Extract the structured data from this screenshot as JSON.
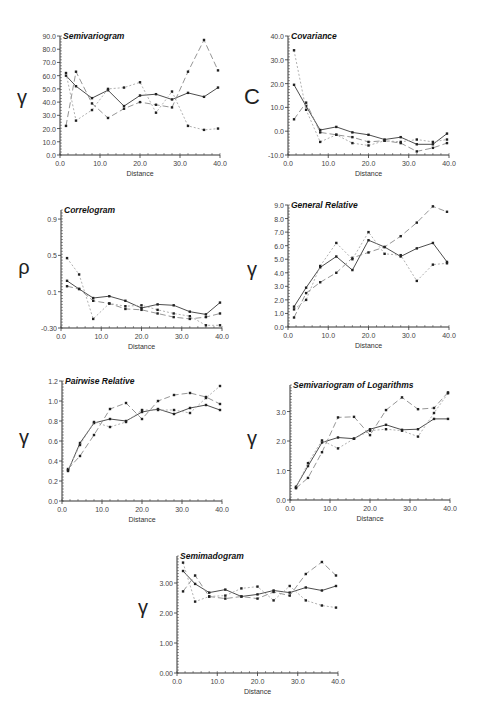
{
  "figure": {
    "x_label": "Distance"
  },
  "styles": {
    "axis_color": "#333333",
    "series": [
      {
        "name": "series-1",
        "style": "solid",
        "color": "#3a3a3a",
        "dash": ""
      },
      {
        "name": "series-2",
        "style": "long-dash",
        "color": "#8a8a8a",
        "dash": "6,3"
      },
      {
        "name": "series-3",
        "style": "dotted",
        "color": "#a8a8a8",
        "dash": "2,2"
      }
    ]
  },
  "chart_data": [
    {
      "id": "semivariogram",
      "type": "line",
      "title": "Semivariogram",
      "xlabel": "Distance",
      "ylabel": "γ",
      "xlim": [
        0,
        40
      ],
      "ylim": [
        0,
        90
      ],
      "xticks": [
        "0.0",
        "10.0",
        "20.0",
        "30.0",
        "40.0"
      ],
      "xtick_values": [
        0,
        10,
        20,
        30,
        40
      ],
      "yticks": [
        "0.0",
        "10.0",
        "20.0",
        "30.0",
        "40.0",
        "50.0",
        "60.0",
        "70.0",
        "80.0",
        "90.0"
      ],
      "ytick_values": [
        0,
        10,
        20,
        30,
        40,
        50,
        60,
        70,
        80,
        90
      ],
      "box": {
        "x0": 60,
        "x1": 220,
        "y0": 36,
        "y1": 155
      },
      "ylabel_pos": {
        "x": 22,
        "y": 104
      },
      "series": [
        {
          "name": "series-1",
          "x": [
            1.5,
            4,
            8,
            12,
            16,
            20,
            24,
            28,
            32,
            36,
            39.5
          ],
          "y": [
            60,
            52,
            43,
            49,
            37,
            45,
            46,
            42,
            47,
            44,
            51
          ]
        },
        {
          "name": "series-2",
          "x": [
            1.5,
            4,
            8,
            12,
            16,
            20,
            24,
            28,
            32,
            36,
            39.5
          ],
          "y": [
            22,
            63,
            39,
            28,
            35,
            40,
            38,
            36,
            63,
            87,
            64
          ]
        },
        {
          "name": "series-3",
          "x": [
            1.5,
            4,
            8,
            12,
            16,
            20,
            24,
            28,
            32,
            36,
            39.5
          ],
          "y": [
            62,
            26,
            34,
            50,
            51,
            55,
            32,
            48,
            22,
            19,
            20
          ]
        }
      ]
    },
    {
      "id": "covariance",
      "type": "line",
      "title": "Covariance",
      "xlabel": "Distance",
      "ylabel": "C",
      "xlim": [
        0,
        40
      ],
      "ylim": [
        -10,
        40
      ],
      "xticks": [
        "0.0",
        "10.0",
        "20.0",
        "30.0",
        "40.0"
      ],
      "xtick_values": [
        0,
        10,
        20,
        30,
        40
      ],
      "yticks": [
        "-10.0",
        "0.0",
        "10.0",
        "20.0",
        "30.0",
        "40.0"
      ],
      "ytick_values": [
        -10,
        0,
        10,
        20,
        30,
        40
      ],
      "box": {
        "x0": 288,
        "x1": 449,
        "y0": 36,
        "y1": 155
      },
      "ylabel_pos": {
        "x": 252,
        "y": 104
      },
      "series": [
        {
          "name": "series-1",
          "x": [
            1.5,
            4.5,
            8,
            12,
            16,
            20,
            24,
            28,
            32,
            36,
            39.5
          ],
          "y": [
            19.5,
            10.5,
            0.5,
            1.8,
            -0.5,
            -1.5,
            -3.5,
            -2.5,
            -5.5,
            -5.5,
            -1.0
          ]
        },
        {
          "name": "series-2",
          "x": [
            1.5,
            4.5,
            8,
            12,
            16,
            20,
            24,
            28,
            32,
            36,
            39.5
          ],
          "y": [
            5,
            12,
            -0.5,
            -1.5,
            -2.5,
            -4.5,
            -4,
            -5,
            -8.5,
            -7,
            -5
          ]
        },
        {
          "name": "series-3",
          "x": [
            1.5,
            4.5,
            8,
            12,
            16,
            20,
            24,
            28,
            32,
            36,
            39.5
          ],
          "y": [
            34,
            9,
            -4.5,
            -1.5,
            -5,
            -6,
            -4,
            -4.5,
            -3.5,
            -4.5,
            -3.5
          ]
        }
      ]
    },
    {
      "id": "correlogram",
      "type": "line",
      "title": "Correlogram",
      "xlabel": "Distance",
      "ylabel": "ρ",
      "xlim": [
        0,
        40
      ],
      "ylim": [
        -0.3,
        1.0
      ],
      "xticks": [
        "0.0",
        "10.0",
        "20.0",
        "30.0",
        "40.0"
      ],
      "xtick_values": [
        0,
        10,
        20,
        30,
        40
      ],
      "yticks": [
        "-0.30",
        "0.1",
        "0.5",
        "0.9"
      ],
      "ytick_values": [
        -0.3,
        0.1,
        0.5,
        0.9
      ],
      "box": {
        "x0": 61,
        "x1": 222,
        "y0": 210,
        "y1": 328
      },
      "ylabel_pos": {
        "x": 24,
        "y": 274
      },
      "series": [
        {
          "name": "series-1",
          "x": [
            1.5,
            4.5,
            8,
            12,
            16,
            20,
            24,
            28,
            32,
            36,
            39.5
          ],
          "y": [
            0.22,
            0.13,
            0.03,
            0.05,
            0.0,
            -0.08,
            -0.04,
            -0.05,
            -0.12,
            -0.15,
            -0.02
          ]
        },
        {
          "name": "series-2",
          "x": [
            1.5,
            4.5,
            8,
            12,
            16,
            20,
            24,
            28,
            32,
            36,
            39.5
          ],
          "y": [
            0.16,
            0.13,
            0.0,
            -0.03,
            -0.09,
            -0.1,
            -0.14,
            -0.18,
            -0.2,
            -0.18,
            -0.14
          ]
        },
        {
          "name": "series-3",
          "x": [
            1.5,
            4.5,
            8,
            12,
            16,
            20,
            24,
            28,
            32,
            36,
            39.5
          ],
          "y": [
            0.47,
            0.29,
            -0.2,
            -0.03,
            -0.06,
            -0.05,
            -0.1,
            -0.14,
            -0.17,
            -0.27,
            -0.27
          ]
        }
      ]
    },
    {
      "id": "general-relative",
      "type": "line",
      "title": "General Relative",
      "xlabel": "Distance",
      "ylabel": "γ",
      "xlim": [
        0,
        40
      ],
      "ylim": [
        0,
        9
      ],
      "xticks": [
        "0.0",
        "10.0",
        "20.0",
        "30.0",
        "40.0"
      ],
      "xtick_values": [
        0,
        10,
        20,
        30,
        40
      ],
      "yticks": [
        "0.0",
        "1.0",
        "2.0",
        "3.0",
        "4.0",
        "5.0",
        "6.0",
        "7.0",
        "8.0",
        "9.0"
      ],
      "ytick_values": [
        0,
        1,
        2,
        3,
        4,
        5,
        6,
        7,
        8,
        9
      ],
      "box": {
        "x0": 288,
        "x1": 449,
        "y0": 205,
        "y1": 327
      },
      "ylabel_pos": {
        "x": 252,
        "y": 276
      },
      "series": [
        {
          "name": "series-1",
          "x": [
            1.5,
            4.5,
            8,
            12,
            16,
            20,
            24,
            28,
            32,
            36,
            39.5
          ],
          "y": [
            1.5,
            2.9,
            4.4,
            5.2,
            4.2,
            6.4,
            5.9,
            5.2,
            5.8,
            6.2,
            4.8
          ]
        },
        {
          "name": "series-2",
          "x": [
            1.5,
            4.5,
            8,
            12,
            16,
            20,
            24,
            28,
            32,
            36,
            39.5
          ],
          "y": [
            0.7,
            2.5,
            3.3,
            4.0,
            5.1,
            5.5,
            5.9,
            6.7,
            7.7,
            8.9,
            8.5
          ]
        },
        {
          "name": "series-3",
          "x": [
            1.5,
            4.5,
            8,
            12,
            16,
            20,
            24,
            28,
            32,
            36,
            39.5
          ],
          "y": [
            1.3,
            2.0,
            4.5,
            6.2,
            5.0,
            7.0,
            5.4,
            5.3,
            3.4,
            4.6,
            4.7
          ]
        }
      ]
    },
    {
      "id": "pairwise-relative",
      "type": "line",
      "title": "Pairwise Relative",
      "xlabel": "Distance",
      "ylabel": "γ",
      "xlim": [
        0,
        40
      ],
      "ylim": [
        0,
        1.2
      ],
      "xticks": [
        "0.0",
        "10.0",
        "20.0",
        "30.0",
        "40.0"
      ],
      "xtick_values": [
        0,
        10,
        20,
        30,
        40
      ],
      "yticks": [
        "0.0",
        "0.2",
        "0.4",
        "0.6",
        "0.8",
        "1.0",
        "1.2"
      ],
      "ytick_values": [
        0,
        0.2,
        0.4,
        0.6,
        0.8,
        1.0,
        1.2
      ],
      "box": {
        "x0": 62,
        "x1": 222,
        "y0": 381,
        "y1": 501
      },
      "ylabel_pos": {
        "x": 24,
        "y": 444
      },
      "series": [
        {
          "name": "series-1",
          "x": [
            1.5,
            4.5,
            8,
            12,
            16,
            20,
            24,
            28,
            32,
            36,
            39.5
          ],
          "y": [
            0.3,
            0.58,
            0.78,
            0.82,
            0.8,
            0.89,
            0.92,
            0.87,
            0.93,
            0.96,
            0.91
          ]
        },
        {
          "name": "series-2",
          "x": [
            1.5,
            4.5,
            8,
            12,
            16,
            20,
            24,
            28,
            32,
            36,
            39.5
          ],
          "y": [
            0.32,
            0.45,
            0.66,
            0.92,
            0.98,
            0.82,
            1.0,
            1.06,
            1.08,
            1.04,
            0.97
          ]
        },
        {
          "name": "series-3",
          "x": [
            1.5,
            4.5,
            8,
            12,
            16,
            20,
            24,
            28,
            32,
            36,
            39.5
          ],
          "y": [
            0.31,
            0.56,
            0.79,
            0.74,
            0.79,
            0.91,
            0.91,
            0.91,
            0.88,
            1.03,
            1.15
          ]
        }
      ]
    },
    {
      "id": "semivariogram-of-logarithms",
      "type": "line",
      "title": "Semivariogram of Logarithms",
      "xlabel": "Distance",
      "ylabel": "γ",
      "xlim": [
        0,
        40
      ],
      "ylim": [
        0,
        3.9
      ],
      "xticks": [
        "0.0",
        "10.0",
        "20.0",
        "30.0",
        "40.0"
      ],
      "xtick_values": [
        0,
        10,
        20,
        30,
        40
      ],
      "yticks": [
        "0.0",
        "1.0",
        "2.0",
        "3.0"
      ],
      "ytick_values": [
        0,
        1,
        2,
        3
      ],
      "box": {
        "x0": 290,
        "x1": 450,
        "y0": 385,
        "y1": 500
      },
      "ylabel_pos": {
        "x": 252,
        "y": 445
      },
      "series": [
        {
          "name": "series-1",
          "x": [
            1.5,
            4.5,
            8,
            12,
            16,
            20,
            24,
            28,
            32,
            36,
            39.5
          ],
          "y": [
            0.45,
            1.15,
            1.95,
            2.12,
            2.08,
            2.4,
            2.55,
            2.38,
            2.4,
            2.75,
            2.75
          ]
        },
        {
          "name": "series-2",
          "x": [
            1.5,
            4.5,
            8,
            12,
            16,
            20,
            24,
            28,
            32,
            36,
            39.5
          ],
          "y": [
            0.4,
            0.75,
            1.62,
            2.8,
            2.82,
            2.2,
            3.05,
            3.48,
            3.08,
            3.12,
            3.65
          ]
        },
        {
          "name": "series-3",
          "x": [
            1.5,
            4.5,
            8,
            12,
            16,
            20,
            24,
            28,
            32,
            36,
            39.5
          ],
          "y": [
            0.42,
            1.25,
            2.02,
            1.75,
            2.08,
            2.35,
            2.4,
            2.35,
            2.15,
            2.95,
            3.62
          ]
        }
      ]
    },
    {
      "id": "semimadogram",
      "type": "line",
      "title": "Semimadogram",
      "xlabel": "Distance",
      "ylabel": "γ",
      "xlim": [
        0,
        40
      ],
      "ylim": [
        0,
        3.9
      ],
      "xticks": [
        "0.0",
        "10.0",
        "20.0",
        "30.0",
        "40.0"
      ],
      "xtick_values": [
        0,
        10,
        20,
        30,
        40
      ],
      "yticks": [
        "0.00",
        "1.00",
        "2.00",
        "3.00"
      ],
      "ytick_values": [
        0,
        1,
        2,
        3
      ],
      "box": {
        "x0": 177,
        "x1": 338,
        "y0": 556,
        "y1": 673
      },
      "ylabel_pos": {
        "x": 143,
        "y": 614
      },
      "series": [
        {
          "name": "series-1",
          "x": [
            1.5,
            4.5,
            8,
            12,
            16,
            20,
            24,
            28,
            32,
            36,
            39.5
          ],
          "y": [
            3.4,
            2.97,
            2.68,
            2.78,
            2.55,
            2.62,
            2.75,
            2.68,
            2.85,
            2.75,
            2.9
          ]
        },
        {
          "name": "series-2",
          "x": [
            1.5,
            4.5,
            8,
            12,
            16,
            20,
            24,
            28,
            32,
            36,
            39.5
          ],
          "y": [
            2.72,
            3.25,
            2.55,
            2.48,
            2.55,
            2.48,
            2.7,
            2.58,
            3.3,
            3.7,
            3.25
          ]
        },
        {
          "name": "series-3",
          "x": [
            1.5,
            4.5,
            8,
            12,
            16,
            20,
            24,
            28,
            32,
            36,
            39.5
          ],
          "y": [
            3.68,
            2.38,
            2.55,
            2.58,
            2.82,
            2.88,
            2.42,
            2.9,
            2.42,
            2.25,
            2.18
          ]
        }
      ]
    }
  ]
}
